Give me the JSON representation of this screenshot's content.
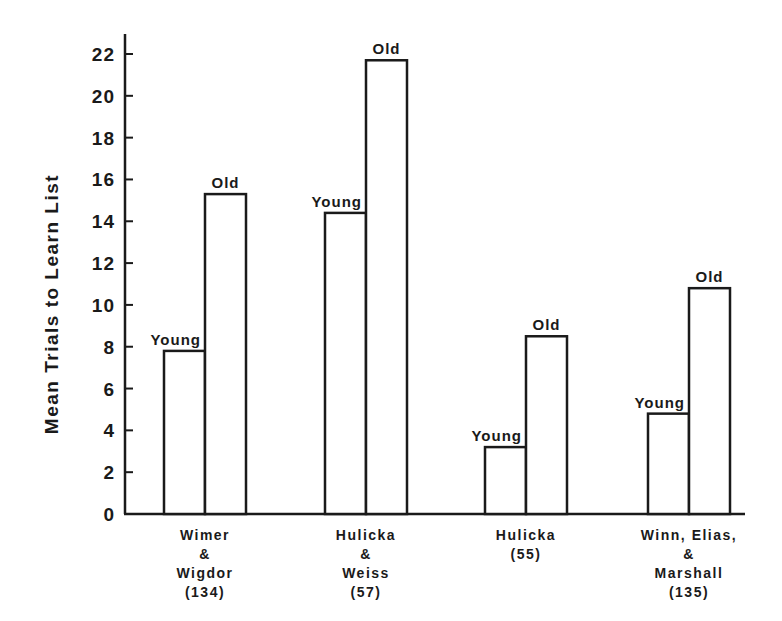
{
  "chart_data": {
    "type": "bar",
    "title": "",
    "xlabel": "",
    "ylabel": "Mean Trials to Learn List",
    "ylim": [
      0,
      22
    ],
    "yticks": [
      0,
      2,
      4,
      6,
      8,
      10,
      12,
      14,
      16,
      18,
      20,
      22
    ],
    "grid": false,
    "legend": "none (bars labeled directly)",
    "categories": [
      [
        "Wimer",
        "&",
        "Wigdor",
        "(134)"
      ],
      [
        "Hulicka",
        "&",
        "Weiss",
        "(57)"
      ],
      [
        "Hulicka",
        "(55)"
      ],
      [
        "Winn, Elias,",
        "&",
        "Marshall",
        "(135)"
      ]
    ],
    "series": [
      {
        "name": "Young",
        "values": [
          7.8,
          14.4,
          3.2,
          4.8
        ]
      },
      {
        "name": "Old",
        "values": [
          15.3,
          21.7,
          8.5,
          10.8
        ]
      }
    ],
    "colors": {
      "bar_fill": "#ffffff",
      "bar_stroke": "#1a1a1a",
      "axis": "#1a1a1a"
    }
  }
}
